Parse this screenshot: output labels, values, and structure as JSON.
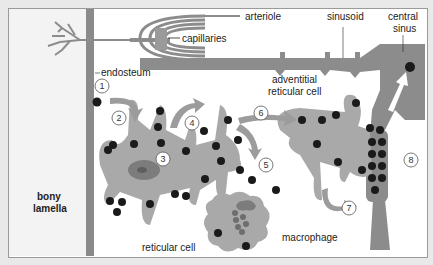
{
  "labels": {
    "arteriole": "arteriole",
    "capillaries": "capillaries",
    "sinusoid": "sinusoid",
    "central_sinus_1": "central",
    "central_sinus_2": "sinus",
    "endosteum": "endosteum",
    "adventitial_1": "adventitial",
    "adventitial_2": "reticular cell",
    "bony_1": "bony",
    "bony_2": "lamella",
    "reticular_cell": "reticular cell",
    "macrophage": "macrophage"
  },
  "steps": [
    "1",
    "2",
    "3",
    "4",
    "5",
    "6",
    "7",
    "8"
  ],
  "colors": {
    "background": "#e9e9e9",
    "panel": "#ffffff",
    "bone": "#f3f3f3",
    "endosteum": "#8a8a8a",
    "cell": "#a9a9a9",
    "vessel": "#8c8c8c",
    "blood_cell": "#1a1a1a",
    "nucleus": "#7c7c7c"
  }
}
